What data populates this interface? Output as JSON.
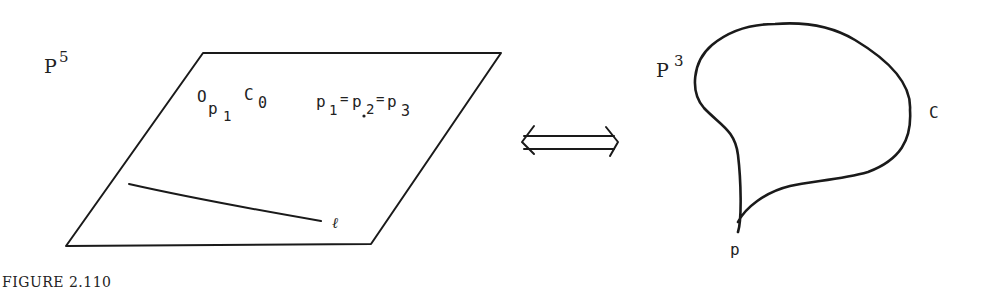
{
  "left_panel": {
    "space_label": "P",
    "space_exponent": "5",
    "plane_label_main": "O",
    "plane_label_sub_p": "p",
    "plane_label_sub_1": "1",
    "plane_label_C": "C",
    "plane_label_C_sub": "0",
    "equation_p1": "p",
    "equation_p1_sub": "1",
    "equation_eq1": "=",
    "equation_p2": "p",
    "equation_p2_sub": "2",
    "equation_eq2": "=",
    "equation_p3": "p",
    "equation_p3_sub": "3",
    "line_label": "ℓ"
  },
  "arrow": {
    "type": "double-arrow",
    "symbol": "⟺"
  },
  "right_panel": {
    "space_label": "P",
    "space_exponent": "3",
    "curve_label": "C",
    "point_label": "p"
  },
  "caption": "FIGURE 2.110"
}
